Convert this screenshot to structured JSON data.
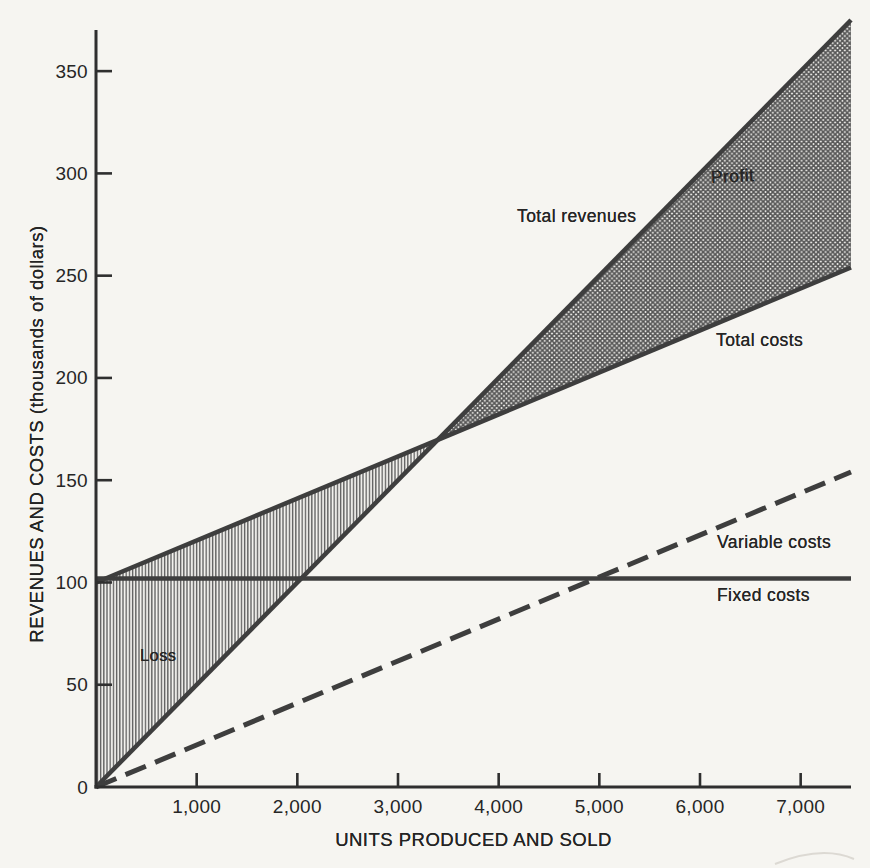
{
  "figure": {
    "background": "#f6f5f1",
    "line_color": "#3e3e3e",
    "axis_color": "#2f2f2f",
    "text_color": "#262626",
    "loss_hatch_color": "#5e5e5e",
    "profit_hatch_color": "#565656"
  },
  "chart_data": {
    "type": "line",
    "title": "",
    "xlabel": "UNITS PRODUCED AND SOLD",
    "ylabel": "REVENUES AND COSTS (thousands of dollars)",
    "xlim": [
      0,
      7500
    ],
    "ylim": [
      0,
      375
    ],
    "grid": false,
    "legend": "inline-labels",
    "x_ticks": [
      {
        "value": 1000,
        "label": "1,000"
      },
      {
        "value": 2000,
        "label": "2,000"
      },
      {
        "value": 3000,
        "label": "3,000"
      },
      {
        "value": 4000,
        "label": "4,000"
      },
      {
        "value": 5000,
        "label": "5,000"
      },
      {
        "value": 6000,
        "label": "6,000"
      },
      {
        "value": 7000,
        "label": "7,000"
      }
    ],
    "y_ticks": [
      {
        "value": 0,
        "label": "0"
      },
      {
        "value": 50,
        "label": "50"
      },
      {
        "value": 100,
        "label": "100"
      },
      {
        "value": 150,
        "label": "150"
      },
      {
        "value": 200,
        "label": "200"
      },
      {
        "value": 250,
        "label": "250"
      },
      {
        "value": 300,
        "label": "300"
      },
      {
        "value": 350,
        "label": "350"
      }
    ],
    "series": [
      {
        "name": "Total revenues",
        "line": "solid",
        "points": [
          [
            0,
            0
          ],
          [
            7500,
            375
          ]
        ]
      },
      {
        "name": "Total costs",
        "line": "solid",
        "points": [
          [
            0,
            100
          ],
          [
            7500,
            254
          ]
        ]
      },
      {
        "name": "Variable costs",
        "line": "dashed",
        "points": [
          [
            0,
            0
          ],
          [
            7500,
            154
          ]
        ]
      },
      {
        "name": "Fixed costs",
        "line": "solid",
        "points": [
          [
            0,
            102
          ],
          [
            7500,
            102
          ]
        ]
      }
    ],
    "regions": [
      {
        "name": "Loss",
        "pattern": "vertical-hatch",
        "points": [
          [
            0,
            0
          ],
          [
            3393,
            169.7
          ],
          [
            0,
            100
          ]
        ]
      },
      {
        "name": "Profit",
        "pattern": "cross-hatch",
        "points": [
          [
            3393,
            169.7
          ],
          [
            7500,
            375
          ],
          [
            7500,
            254
          ]
        ]
      }
    ],
    "break_even": {
      "units": 3400,
      "value_thousands": 170
    },
    "labels": {
      "total_revenues": "Total revenues",
      "profit": "Profit",
      "total_costs": "Total costs",
      "variable_costs": "Variable costs",
      "fixed_costs": "Fixed costs",
      "loss": "Loss"
    }
  }
}
